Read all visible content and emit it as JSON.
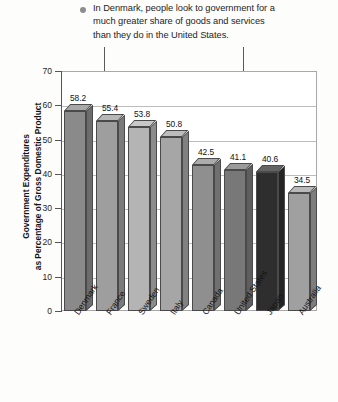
{
  "caption": {
    "bullet_icon": "bullet-dot-icon",
    "text": "In Denmark, people look to government for a\nmuch greater share of goods and services\nthan they do in the United States."
  },
  "annotations": [
    {
      "name": "arrow-denmark",
      "points_to": "Denmark",
      "icon": "down-arrow-icon"
    },
    {
      "name": "arrow-united-states",
      "points_to": "United States",
      "icon": "down-arrow-icon"
    }
  ],
  "colors": {
    "bar_denmark": "#8a8a8a",
    "bar_france": "#9e9e9e",
    "bar_sweden": "#b4b4b4",
    "bar_italy": "#a6a6a6",
    "bar_canada": "#8f8f8f",
    "bar_united_states": "#787878",
    "bar_japan": "#2e2e2e",
    "bar_australia": "#a0a0a0",
    "axis": "#555555",
    "gridline": "#bdbdbd",
    "frame": "#a8a8a8",
    "text": "#141414",
    "bullet": "#8d8d8d"
  },
  "chart_data": {
    "type": "bar",
    "title": "",
    "xlabel": "",
    "ylabel": "Government Expenditures\nas Percentage of Gross Domestic Product",
    "ylim": [
      0,
      70
    ],
    "yticks": [
      0,
      10,
      20,
      30,
      40,
      50,
      60,
      70
    ],
    "grid": true,
    "legend": "none",
    "categories": [
      "Denmark",
      "France",
      "Sweden",
      "Italy",
      "Canada",
      "United States",
      "Japan",
      "Australia"
    ],
    "values": [
      58.2,
      55.4,
      53.8,
      50.8,
      42.5,
      41.1,
      40.6,
      34.5
    ],
    "value_labels": [
      "58.2",
      "55.4",
      "53.8",
      "50.8",
      "42.5",
      "41.1",
      "40.6",
      "34.5"
    ],
    "bar_colors": [
      "#8a8a8a",
      "#9e9e9e",
      "#b4b4b4",
      "#a6a6a6",
      "#8f8f8f",
      "#787878",
      "#2e2e2e",
      "#a0a0a0"
    ]
  }
}
